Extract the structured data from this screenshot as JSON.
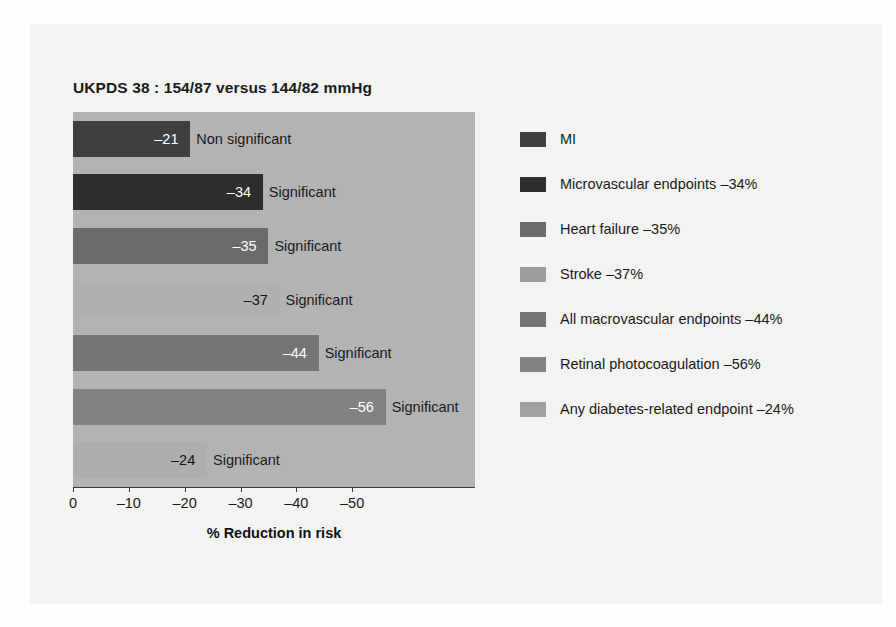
{
  "chart_data": {
    "type": "bar",
    "title": "UKPDS 38 : 154/87 versus 144/82 mmHg",
    "xlabel": "% Reduction in risk",
    "ylabel": "",
    "orientation": "horizontal",
    "xlim": [
      0,
      -55
    ],
    "grid": false,
    "legend_position": "right",
    "plot_background": "#b3b3b3",
    "tick_labels": [
      "0",
      "–10",
      "–20",
      "–30",
      "–40",
      "–50"
    ],
    "tick_values": [
      0,
      -10,
      -20,
      -30,
      -40,
      -50
    ],
    "categories": [
      "MI",
      "Microvascular endpoints",
      "Heart failure",
      "Stroke",
      "All macrovascular endpoints",
      "Retinal photocoagulation",
      "Any diabetes-related endpoint"
    ],
    "values": [
      -21,
      -34,
      -35,
      -37,
      -44,
      -56,
      -24
    ],
    "value_labels": [
      "–21",
      "–34",
      "–35",
      "–37",
      "–44",
      "–56",
      "–24"
    ],
    "significance": [
      "Non significant",
      "Significant",
      "Significant",
      "Significant",
      "Significant",
      "Significant",
      "Significant"
    ],
    "colors": [
      "#3f3f3f",
      "#2e2e2e",
      "#6b6b6b",
      "#b0b0b0",
      "#757575",
      "#828282",
      "#aeaeae"
    ],
    "legend": [
      {
        "label": "MI",
        "color": "#3f3f3f"
      },
      {
        "label": "Microvascular endpoints –34%",
        "color": "#2e2e2e"
      },
      {
        "label": "Heart failure –35%",
        "color": "#6b6b6b"
      },
      {
        "label": "Stroke –37%",
        "color": "#9d9d9d"
      },
      {
        "label": "All macrovascular endpoints –44%",
        "color": "#757575"
      },
      {
        "label": "Retinal photocoagulation –56%",
        "color": "#828282"
      },
      {
        "label": "Any diabetes-related endpoint –24%",
        "color": "#a0a0a0"
      }
    ]
  }
}
